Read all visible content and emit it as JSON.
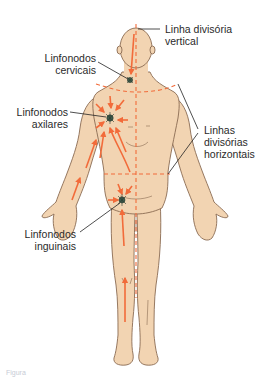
{
  "figure": {
    "colors": {
      "skin": "#F2D4B2",
      "outline": "#8A6B52",
      "arrow": "#F26B3A",
      "node": "#3E5A4A",
      "leader": "#222222",
      "text": "#2A2A2A"
    }
  },
  "labels": {
    "vertical_line": {
      "line1": "Linha divisória",
      "line2": "vertical"
    },
    "cervical": {
      "line1": "Linfonodos",
      "line2": "cervicais"
    },
    "axillary": {
      "line1": "Linfonodos",
      "line2": "axilares"
    },
    "horizontal_lines": {
      "line1": "Linhas",
      "line2": "divisórias",
      "line3": "horizontais"
    },
    "inguinal": {
      "line1": "Linfonodos",
      "line2": "inguinais"
    }
  },
  "caption": {
    "text": "Figura"
  }
}
